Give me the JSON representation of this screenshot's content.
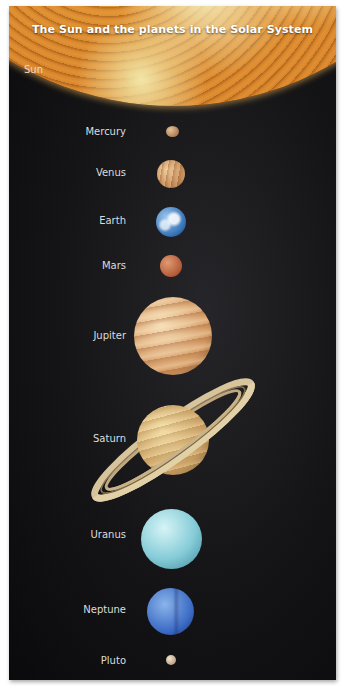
{
  "title": "The Sun and the planets in the Solar System",
  "sun": {
    "label": "Sun",
    "color": "#d8892c"
  },
  "planets": [
    {
      "name": "Mercury",
      "color": "#b08860"
    },
    {
      "name": "Venus",
      "color": "#c99060"
    },
    {
      "name": "Earth",
      "color": "#4a86c4"
    },
    {
      "name": "Mars",
      "color": "#b85e3c"
    },
    {
      "name": "Jupiter",
      "color": "#d8a470"
    },
    {
      "name": "Saturn",
      "color": "#d4ac6c"
    },
    {
      "name": "Uranus",
      "color": "#8cd0dc"
    },
    {
      "name": "Neptune",
      "color": "#3e70c8"
    },
    {
      "name": "Pluto",
      "color": "#c0a888"
    }
  ],
  "colors": {
    "background": "#121214",
    "label_text": "#dcdcdc",
    "title_text": "#ffffff"
  }
}
